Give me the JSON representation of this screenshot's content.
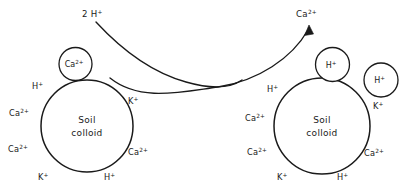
{
  "figure": {
    "stroke_color": "#1a1a1a",
    "background_color": "#ffffff"
  },
  "flows": {
    "incoming": {
      "label": "2 H",
      "charge": "+",
      "full_label": "2 H+",
      "direction": "left-to-right",
      "has_arrowhead": false
    },
    "outgoing": {
      "label": "Ca",
      "charge": "2+",
      "full_label": "Ca2+",
      "direction": "left-to-right-up",
      "has_arrowhead": true
    }
  },
  "left_colloid": {
    "name": "Soil colloid (calcium saturated)",
    "center_label_line1": "Soil",
    "center_label_line2": "colloid",
    "detached_ion": {
      "label": "Ca",
      "charge": "2+",
      "full_label": "Ca2+"
    },
    "surface_ions": [
      {
        "label": "H",
        "charge": "+",
        "full_label": "H+",
        "position": "upper-left"
      },
      {
        "label": "Ca",
        "charge": "2+",
        "full_label": "Ca2+",
        "position": "left"
      },
      {
        "label": "Ca",
        "charge": "2+",
        "full_label": "Ca2+",
        "position": "lower-left"
      },
      {
        "label": "K",
        "charge": "+",
        "full_label": "K+",
        "position": "bottom-left"
      },
      {
        "label": "H",
        "charge": "+",
        "full_label": "H+",
        "position": "bottom-right"
      },
      {
        "label": "Ca",
        "charge": "2+",
        "full_label": "Ca2+",
        "position": "lower-right"
      },
      {
        "label": "K",
        "charge": "+",
        "full_label": "K+",
        "position": "upper-right"
      }
    ]
  },
  "right_colloid": {
    "name": "Soil colloid (hydrogen saturated)",
    "center_label_line1": "Soil",
    "center_label_line2": "colloid",
    "detached_ions": [
      {
        "label": "H",
        "charge": "+",
        "full_label": "H+",
        "position": "top"
      },
      {
        "label": "H",
        "charge": "+",
        "full_label": "H+",
        "position": "upper-right"
      }
    ],
    "surface_ions": [
      {
        "label": "H",
        "charge": "+",
        "full_label": "H+",
        "position": "upper-left"
      },
      {
        "label": "Ca",
        "charge": "2+",
        "full_label": "Ca2+",
        "position": "left"
      },
      {
        "label": "Ca",
        "charge": "2+",
        "full_label": "Ca2+",
        "position": "lower-left"
      },
      {
        "label": "K",
        "charge": "+",
        "full_label": "K+",
        "position": "bottom-left"
      },
      {
        "label": "H",
        "charge": "+",
        "full_label": "H+",
        "position": "bottom-right"
      },
      {
        "label": "Ca",
        "charge": "2+",
        "full_label": "Ca2+",
        "position": "lower-right"
      },
      {
        "label": "K",
        "charge": "+",
        "full_label": "K+",
        "position": "right"
      }
    ]
  }
}
